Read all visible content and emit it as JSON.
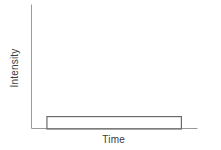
{
  "figure": {
    "background_color": "#ffffff",
    "width": 221,
    "height": 150
  },
  "axes": {
    "y_axis_label": "Intensity",
    "x_axis_label": "Time",
    "axis_color": "#9a9a9a",
    "tick_labels_x": [],
    "tick_labels_y": [],
    "grid": "off"
  },
  "series": {
    "pulse_color": "#6b6b6b",
    "pulse_fill": "none"
  },
  "chart_data": {
    "type": "area",
    "title": "",
    "subtitle": "",
    "xlabel": "Time",
    "ylabel": "Intensity",
    "xlim": [
      0,
      1
    ],
    "ylim": [
      0,
      1
    ],
    "grid": false,
    "legend": "none",
    "tick_labels_x": [],
    "tick_labels_y": [],
    "annotations": [],
    "series": [
      {
        "name": "Rectangular pulse",
        "shape": "rectangular",
        "x": [
          0.0,
          0.09,
          0.09,
          0.9,
          0.9,
          1.0
        ],
        "values": [
          0.0,
          0.0,
          0.1,
          0.1,
          0.0,
          0.0
        ],
        "pulse_start_x": 0.09,
        "pulse_end_x": 0.9,
        "pulse_amplitude": 0.1,
        "color": "#6b6b6b",
        "filled": false
      }
    ]
  }
}
